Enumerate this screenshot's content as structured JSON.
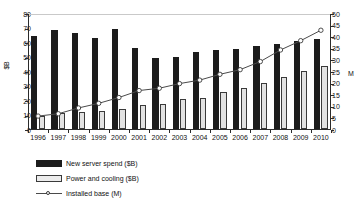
{
  "chart_data": {
    "type": "bar",
    "title": "",
    "subtitle": "",
    "xlabel": "",
    "ylabel": "$B",
    "ylabel_right": "M",
    "categories": [
      "1996",
      "1997",
      "1998",
      "1999",
      "2000",
      "2001",
      "2002",
      "2003",
      "2004",
      "2005",
      "2006",
      "2007",
      "2008",
      "2009",
      "2010"
    ],
    "ylim": [
      0,
      80
    ],
    "ylim_right": [
      0,
      50
    ],
    "yticks": [
      0,
      10,
      20,
      30,
      40,
      50,
      60,
      70,
      80
    ],
    "yticks_right": [
      0,
      5,
      10,
      15,
      20,
      25,
      30,
      35,
      40,
      45,
      50
    ],
    "grid": false,
    "legend_position": "bottom-left",
    "series": [
      {
        "name": "New server spend ($B)",
        "type": "bar",
        "axis": "left",
        "color": "#1c1c1c",
        "values": [
          64,
          68,
          66,
          63,
          69,
          56,
          49,
          50,
          53,
          54.5,
          55,
          57,
          58.5,
          60.5,
          62
        ]
      },
      {
        "name": "Power and cooling ($B)",
        "type": "bar",
        "axis": "left",
        "color": "#e2e2e2",
        "values": [
          9,
          11,
          12,
          12.5,
          14,
          16.5,
          17.5,
          20.5,
          21.5,
          25.5,
          28,
          31.5,
          36,
          40,
          43.5
        ]
      },
      {
        "name": "Installed base (M)",
        "type": "line",
        "axis": "right",
        "color": "#4a4a4a",
        "marker": "open-circle",
        "values": [
          6,
          7,
          9.5,
          11.5,
          14,
          17,
          18,
          20,
          21.5,
          24,
          26,
          29.5,
          34.5,
          38.5,
          43
        ]
      }
    ]
  },
  "legend": {
    "items": [
      {
        "label": "New server spend ($B)",
        "key": "filled-square-key"
      },
      {
        "label": "Power and cooling ($B)",
        "key": "hollow-square-key"
      },
      {
        "label": "Installed base (M)",
        "key": "line-marker-key"
      }
    ]
  }
}
